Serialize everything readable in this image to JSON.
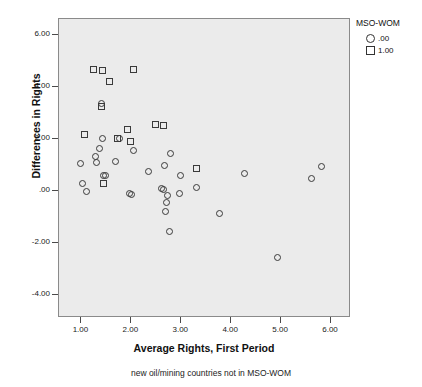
{
  "chart_data": {
    "type": "scatter",
    "title": "",
    "caption": "new oil/mining countries not in MSO-WOM",
    "xlabel": "Average Rights, First Period",
    "ylabel": "Differences in Rights",
    "xlim": [
      0.55,
      6.4
    ],
    "ylim": [
      -4.9,
      6.6
    ],
    "xticks": [
      "1.00",
      "2.00",
      "3.00",
      "4.00",
      "5.00",
      "6.00"
    ],
    "xtick_values": [
      1.0,
      2.0,
      3.0,
      4.0,
      5.0,
      6.0
    ],
    "yticks": [
      "6.00",
      "4.00",
      "2.00",
      ".00",
      "-2.00",
      "-4.00"
    ],
    "ytick_values": [
      6.0,
      4.0,
      2.0,
      0.0,
      -2.0,
      -4.0
    ],
    "grid": false,
    "legend_position": "right",
    "legend_title": "MSO-WOM",
    "series": [
      {
        "name": ".00",
        "marker": "circle",
        "points": [
          [
            1.0,
            1.0
          ],
          [
            1.05,
            0.22
          ],
          [
            1.12,
            -0.07
          ],
          [
            1.3,
            1.28
          ],
          [
            1.33,
            1.05
          ],
          [
            1.38,
            1.6
          ],
          [
            1.42,
            3.33
          ],
          [
            1.45,
            1.95
          ],
          [
            1.47,
            0.55
          ],
          [
            1.5,
            0.53
          ],
          [
            1.7,
            1.1
          ],
          [
            1.78,
            1.98
          ],
          [
            1.98,
            -0.15
          ],
          [
            2.03,
            -0.17
          ],
          [
            2.07,
            1.5
          ],
          [
            2.37,
            0.68
          ],
          [
            2.62,
            0.03
          ],
          [
            2.67,
            0.02
          ],
          [
            2.68,
            0.93
          ],
          [
            2.7,
            -0.83
          ],
          [
            2.73,
            -0.48
          ],
          [
            2.75,
            -0.24
          ],
          [
            2.78,
            -1.6
          ],
          [
            2.8,
            1.4
          ],
          [
            2.98,
            -0.14
          ],
          [
            3.0,
            0.54
          ],
          [
            3.32,
            0.07
          ],
          [
            3.78,
            -0.92
          ],
          [
            4.28,
            0.62
          ],
          [
            4.95,
            -2.62
          ],
          [
            5.63,
            0.43
          ],
          [
            5.82,
            0.87
          ]
        ]
      },
      {
        "name": "1.00",
        "marker": "square",
        "points": [
          [
            1.08,
            2.12
          ],
          [
            1.27,
            4.62
          ],
          [
            1.42,
            3.18
          ],
          [
            1.45,
            4.58
          ],
          [
            1.47,
            0.24
          ],
          [
            1.58,
            4.17
          ],
          [
            1.75,
            1.95
          ],
          [
            1.95,
            2.33
          ],
          [
            2.0,
            1.85
          ],
          [
            2.07,
            4.62
          ],
          [
            2.5,
            2.5
          ],
          [
            2.67,
            2.48
          ],
          [
            3.33,
            0.83
          ]
        ]
      }
    ]
  },
  "legend": {
    "title": "MSO-WOM",
    "entries": [
      {
        "glyph": "circle-marker-icon",
        "label": ".00"
      },
      {
        "glyph": "square-marker-icon",
        "label": "1.00"
      }
    ]
  }
}
